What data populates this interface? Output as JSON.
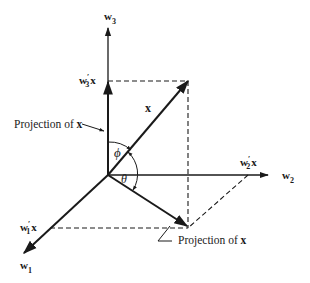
{
  "axes": {
    "w1": {
      "label": "w",
      "sub": "1"
    },
    "w2": {
      "label": "w",
      "sub": "2"
    },
    "w3": {
      "label": "w",
      "sub": "3"
    }
  },
  "projections": {
    "w1x": {
      "label": "w",
      "prime": "′",
      "sub": "1",
      "suffix": "x"
    },
    "w2x": {
      "label": "w",
      "prime": "′",
      "sub": "2",
      "suffix": "x"
    },
    "w3x": {
      "label": "w",
      "prime": "′",
      "sub": "3",
      "suffix": "x"
    }
  },
  "vector": {
    "label": "x"
  },
  "angles": {
    "phi": "ϕ",
    "theta": "θ"
  },
  "annotations": {
    "projection_left": {
      "text": "Projection of ",
      "bold": "x"
    },
    "projection_bottom": {
      "text": "Projection of ",
      "bold": "x"
    }
  },
  "colors": {
    "ink": "#1a1a1a",
    "background": "#ffffff"
  }
}
